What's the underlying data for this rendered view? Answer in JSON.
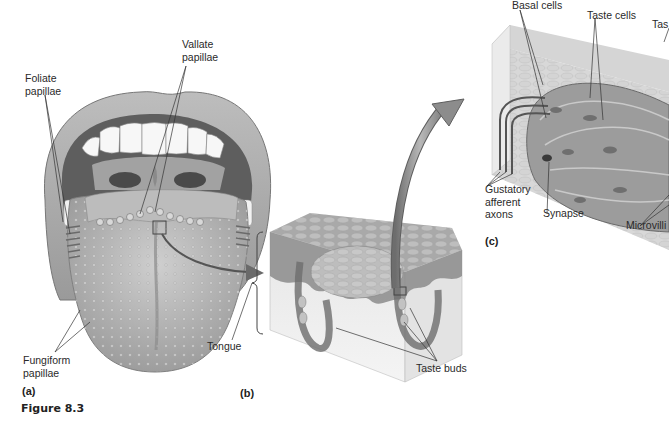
{
  "figure": {
    "caption": "Figure 8.3"
  },
  "panels": {
    "a": {
      "label": "(a)",
      "title": "Tongue (surface view)"
    },
    "b": {
      "label": "(b)"
    },
    "c": {
      "label": "(c)"
    }
  },
  "labels": {
    "foliate": [
      "Foliate",
      "papillae"
    ],
    "vallate": [
      "Vallate",
      "papillae"
    ],
    "fungiform": [
      "Fungiform",
      "papillae"
    ],
    "tongue": "Tongue",
    "taste_buds": "Taste buds",
    "basal_cells": "Basal cells",
    "taste_cells": "Taste cells",
    "taste_pore_partial": "Tas",
    "gustatory": [
      "Gustatory",
      "afferent",
      "axons"
    ],
    "synapse": "Synapse",
    "microvilli": "Microvilli"
  },
  "colors": {
    "background": "#ffffff",
    "tissue_dark": "#7a7a7a",
    "tissue_mid": "#a8a8a8",
    "tissue_light": "#d6d6d6",
    "tissue_pale": "#ececec",
    "line": "#333333",
    "arrow": "#8a8a8a"
  }
}
